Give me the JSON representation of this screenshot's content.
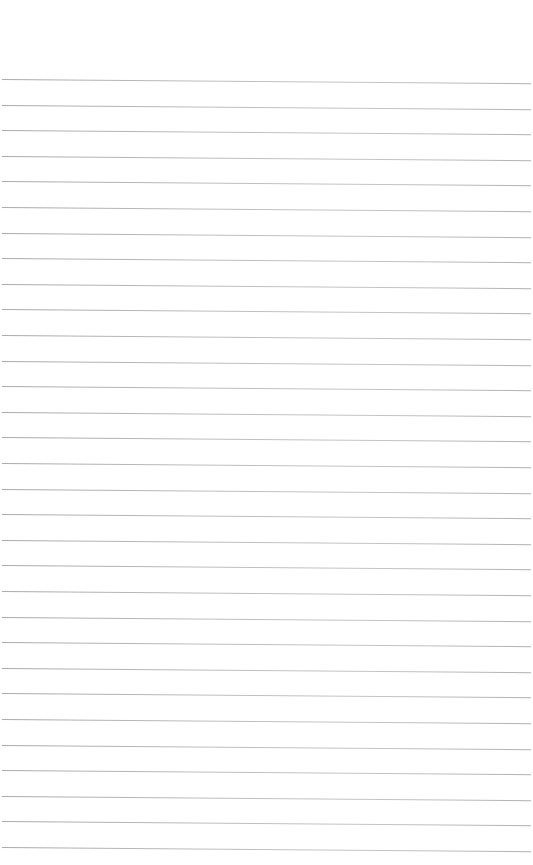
{
  "page": {
    "type": "lined-paper",
    "background_color": "#ffffff",
    "line_color": "#b8b8b8",
    "line_count": 31,
    "first_line_y": 79,
    "line_spacing": 25.6,
    "text_content": ""
  }
}
